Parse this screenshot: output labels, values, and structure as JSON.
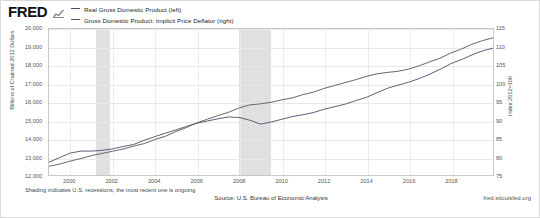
{
  "header": {
    "logo_text": "FRED",
    "logo_glyph": "chart-glyph"
  },
  "legend": {
    "items": [
      {
        "label": "Real Gross Domestic Product (left)",
        "color": "#4a4a6a"
      },
      {
        "label": "Gross Domestic Product: Implicit Price Deflator (right)",
        "color": "#555555"
      }
    ]
  },
  "footer": {
    "note": "Shading indicates U.S. recessions, the most recent one is ongoing",
    "source": "Source: U.S. Bureau of Economic Analysis",
    "url": "fred.stlouisfed.org"
  },
  "chart_data": {
    "type": "line",
    "title": "",
    "xlabel": "",
    "ylabel": "Billions of Chained 2012 Dollars",
    "ylabel_right": "Index 2012=100",
    "xlim": [
      1999.0,
      2020.0
    ],
    "ylim": [
      12000,
      20000
    ],
    "ylim_right": [
      75,
      115
    ],
    "grid": true,
    "legend_position": "top-left",
    "xticks": [
      "2000",
      "2002",
      "2004",
      "2006",
      "2008",
      "2010",
      "2012",
      "2014",
      "2016",
      "2018"
    ],
    "xtick_values": [
      2000,
      2002,
      2004,
      2006,
      2008,
      2010,
      2012,
      2014,
      2016,
      2018
    ],
    "yticks_left": [
      "12,000",
      "13,000",
      "14,000",
      "15,000",
      "16,000",
      "17,000",
      "18,000",
      "19,000",
      "20,000"
    ],
    "ytick_values_left": [
      12000,
      13000,
      14000,
      15000,
      16000,
      17000,
      18000,
      19000,
      20000
    ],
    "yticks_right": [
      "75",
      "80",
      "85",
      "90",
      "95",
      "100",
      "105",
      "110",
      "115"
    ],
    "ytick_values_right": [
      75,
      80,
      85,
      90,
      95,
      100,
      105,
      110,
      115
    ],
    "recessions": [
      {
        "start": 2001.2,
        "end": 2001.85
      },
      {
        "start": 2007.95,
        "end": 2009.45
      },
      {
        "start": 2020.1,
        "end": 2020.45
      }
    ],
    "series": [
      {
        "name": "Real Gross Domestic Product (left)",
        "axis": "left",
        "color": "#4a4a6a",
        "x": [
          1999.0,
          1999.5,
          2000.0,
          2000.5,
          2001.0,
          2001.5,
          2002.0,
          2002.5,
          2003.0,
          2003.5,
          2004.0,
          2004.5,
          2005.0,
          2005.5,
          2006.0,
          2006.5,
          2007.0,
          2007.5,
          2008.0,
          2008.5,
          2009.0,
          2009.5,
          2010.0,
          2010.5,
          2011.0,
          2011.5,
          2012.0,
          2012.5,
          2013.0,
          2013.5,
          2014.0,
          2014.5,
          2015.0,
          2015.5,
          2016.0,
          2016.5,
          2017.0,
          2017.5,
          2018.0,
          2018.5,
          2019.0,
          2019.5,
          2020.0
        ],
        "y": [
          12700,
          12950,
          13200,
          13310,
          13310,
          13350,
          13430,
          13560,
          13670,
          13900,
          14100,
          14290,
          14470,
          14660,
          14840,
          14960,
          15080,
          15180,
          15150,
          15000,
          14790,
          14900,
          15050,
          15200,
          15300,
          15420,
          15600,
          15740,
          15880,
          16070,
          16250,
          16500,
          16750,
          16920,
          17080,
          17280,
          17520,
          17790,
          18100,
          18320,
          18580,
          18800,
          18950
        ]
      },
      {
        "name": "Gross Domestic Product: Implicit Price Deflator (right)",
        "axis": "right",
        "color": "#555555",
        "x": [
          1999.0,
          1999.5,
          2000.0,
          2000.5,
          2001.0,
          2001.5,
          2002.0,
          2002.5,
          2003.0,
          2003.5,
          2004.0,
          2004.5,
          2005.0,
          2005.5,
          2006.0,
          2006.5,
          2007.0,
          2007.5,
          2008.0,
          2008.5,
          2009.0,
          2009.5,
          2010.0,
          2010.5,
          2011.0,
          2011.5,
          2012.0,
          2012.5,
          2013.0,
          2013.5,
          2014.0,
          2014.5,
          2015.0,
          2015.5,
          2016.0,
          2016.5,
          2017.0,
          2017.5,
          2018.0,
          2018.5,
          2019.0,
          2019.5,
          2020.0
        ],
        "y": [
          77.4,
          78.0,
          78.8,
          79.5,
          80.3,
          80.9,
          81.5,
          82.1,
          82.9,
          83.6,
          84.7,
          85.6,
          86.9,
          88.0,
          89.3,
          90.3,
          91.3,
          92.2,
          93.4,
          94.2,
          94.5,
          94.9,
          95.6,
          96.1,
          97.0,
          97.7,
          98.7,
          99.5,
          100.3,
          101.1,
          102.0,
          102.7,
          103.1,
          103.4,
          104.0,
          104.9,
          106.0,
          107.0,
          108.4,
          109.5,
          110.8,
          111.8,
          112.6
        ]
      }
    ]
  }
}
